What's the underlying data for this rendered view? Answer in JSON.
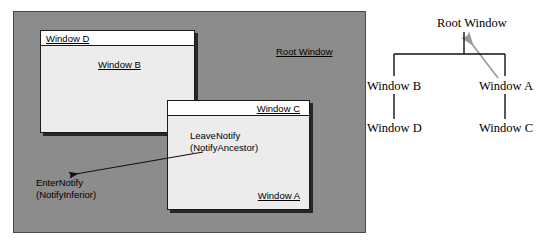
{
  "figure": {
    "type": "diagram"
  },
  "illustration": {
    "root_window_label": "Root Window",
    "windows": [
      {
        "id": "window-d",
        "title": "Window D",
        "title_align": "left",
        "inner_label": "Window B",
        "inner_label_align": "center"
      },
      {
        "id": "window-c",
        "title": "Window C",
        "title_align": "right",
        "inner_label": "Window A",
        "inner_label_align": "right"
      }
    ],
    "annotations": {
      "leave_notify_line1": "LeaveNotify",
      "leave_notify_line2": "(NotifyAncestor)",
      "enter_notify_line1": "EnterNotify",
      "enter_notify_line2": "(NotifyInferior)"
    }
  },
  "tree": {
    "nodes": [
      {
        "id": "root",
        "label": "Root Window"
      },
      {
        "id": "window-b",
        "label": "Window B"
      },
      {
        "id": "window-a",
        "label": "Window A"
      },
      {
        "id": "window-d",
        "label": "Window D"
      },
      {
        "id": "window-c",
        "label": "Window C"
      }
    ],
    "edges": [
      {
        "from": "root",
        "to": "window-b"
      },
      {
        "from": "root",
        "to": "window-a"
      },
      {
        "from": "window-b",
        "to": "window-d"
      },
      {
        "from": "window-a",
        "to": "window-c"
      }
    ]
  },
  "colors": {
    "root_window_fill": "#8c8c8c",
    "window_fill": "#ececec",
    "titlebar_fill": "#ffffff",
    "stroke": "#1a1a1a",
    "shadow": "#262626",
    "gray_arrow": "#9a9a9a",
    "text": "#000000"
  }
}
